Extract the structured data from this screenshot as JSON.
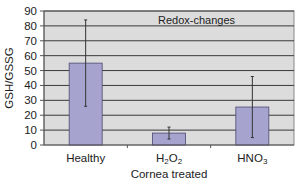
{
  "chart_data": {
    "type": "bar",
    "title": "Redox-changes",
    "xlabel": "Cornea treated",
    "ylabel": "GSH/GSSG",
    "ylim": [
      0,
      90
    ],
    "yticks": [
      0,
      10,
      20,
      30,
      40,
      50,
      60,
      70,
      80,
      90
    ],
    "categories": [
      "Healthy",
      "H2O2",
      "HNO3"
    ],
    "category_display": [
      {
        "main": "Healthy",
        "parts": []
      },
      {
        "main": "",
        "parts": [
          [
            "H",
            ""
          ],
          [
            "2",
            "sub"
          ],
          [
            "O",
            ""
          ],
          [
            "2",
            "sub"
          ]
        ]
      },
      {
        "main": "",
        "parts": [
          [
            "HNO",
            ""
          ],
          [
            "3",
            "sub"
          ]
        ]
      }
    ],
    "values": [
      55,
      8,
      25.5
    ],
    "error": [
      29,
      4,
      20.5
    ],
    "grid": true,
    "legend": "none",
    "colors": {
      "bar": "#a6a4cf",
      "bar_edge": "#4a4870",
      "plot_bg": "#dcdcdc",
      "grid": "#3a3a3a"
    }
  }
}
